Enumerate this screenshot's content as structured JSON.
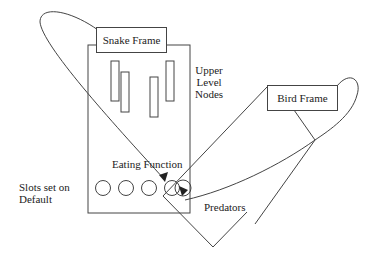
{
  "diagram": {
    "snake_frame": {
      "label": "Snake Frame"
    },
    "bird_frame": {
      "label": "Bird Frame"
    },
    "upper_level_nodes": {
      "line1": "Upper",
      "line2": "Level",
      "line3": "Nodes"
    },
    "eating_function": {
      "label": "Eating Function"
    },
    "slots_default": {
      "line1": "Slots set on",
      "line2": "Default"
    },
    "predators": {
      "label": "Predators"
    },
    "slot_count": 5,
    "stroke_color": "#444444"
  }
}
